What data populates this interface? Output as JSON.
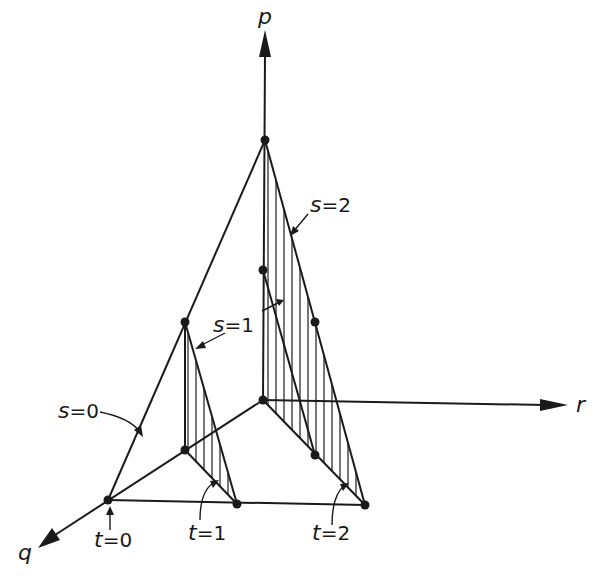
{
  "axes": {
    "p": {
      "label": "p"
    },
    "q": {
      "label": "q"
    },
    "r": {
      "label": "r"
    }
  },
  "annotations": {
    "s0": {
      "var": "s",
      "eq": "=0"
    },
    "s1": {
      "var": "s",
      "eq": "=1"
    },
    "s2": {
      "var": "s",
      "eq": "=2"
    },
    "t0": {
      "var": "t",
      "eq": "=0"
    },
    "t1": {
      "var": "t",
      "eq": "=1"
    },
    "t2": {
      "var": "t",
      "eq": "=2"
    }
  },
  "colors": {
    "ink": "#1a1a1a",
    "background": "#ffffff"
  }
}
